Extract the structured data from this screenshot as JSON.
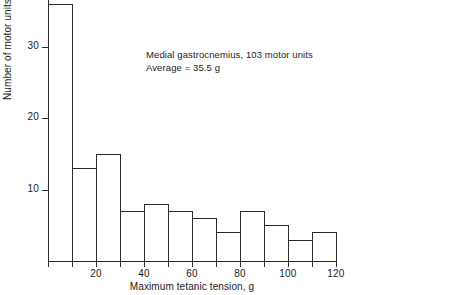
{
  "chart_data": {
    "type": "bar",
    "title": "",
    "subtitle": "",
    "xlabel": "Maximum tetanic tension, g",
    "ylabel": "Number of motor units",
    "xlim": [
      0,
      120
    ],
    "ylim": [
      0,
      37
    ],
    "grid": false,
    "legend": null,
    "bin_width": 10,
    "categories": [
      "0-10",
      "10-20",
      "20-30",
      "30-40",
      "40-50",
      "50-60",
      "60-70",
      "70-80",
      "80-90",
      "90-100",
      "100-110",
      "110-120"
    ],
    "bin_edges": [
      0,
      10,
      20,
      30,
      40,
      50,
      60,
      70,
      80,
      90,
      100,
      110,
      120
    ],
    "values": [
      36,
      13,
      15,
      7,
      8,
      7,
      6,
      4,
      7,
      5,
      3,
      4
    ],
    "xticks": [
      {
        "value": 20,
        "label": "20"
      },
      {
        "value": 40,
        "label": "40"
      },
      {
        "value": 60,
        "label": "60"
      },
      {
        "value": 80,
        "label": "80"
      },
      {
        "value": 100,
        "label": "100"
      },
      {
        "value": 120,
        "label": "120"
      }
    ],
    "yticks": [
      {
        "value": 10,
        "label": "10"
      },
      {
        "value": 20,
        "label": "20"
      },
      {
        "value": 30,
        "label": "30"
      }
    ],
    "annotations": [
      "Medial gastrocnemius, 103 motor units",
      "Average = 35.5 g"
    ],
    "colors": {
      "bar_fill": "#ffffff",
      "bar_stroke": "#2b2b2b",
      "axis": "#2b2b2b",
      "text": "#1b1b1b",
      "background": "#ffffff"
    }
  }
}
